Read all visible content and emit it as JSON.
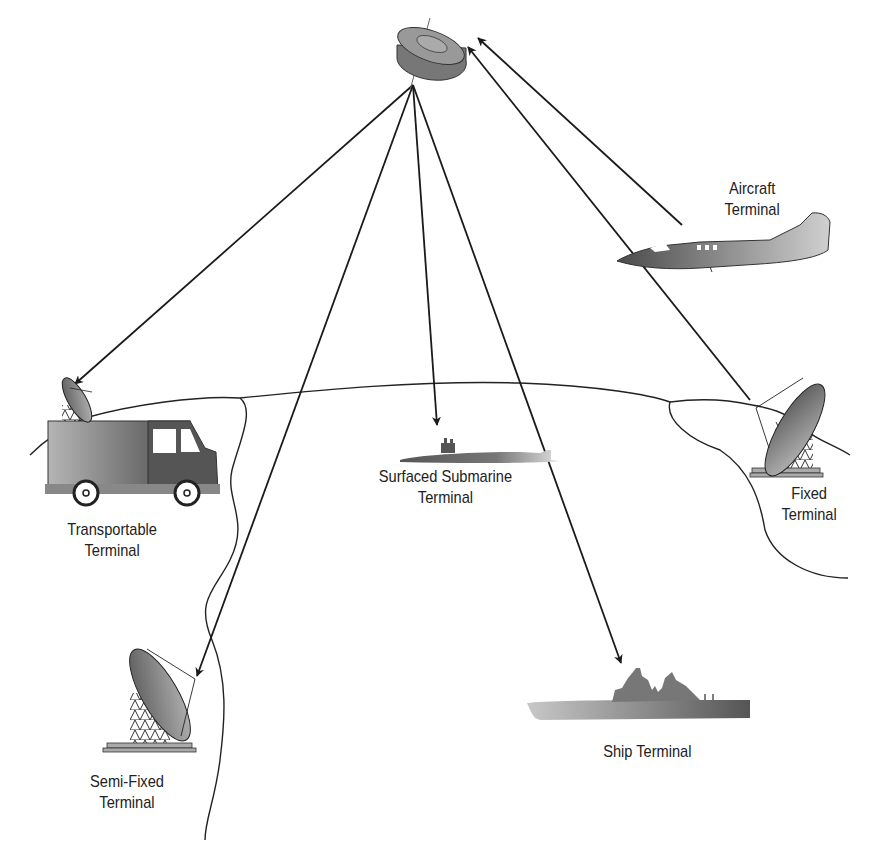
{
  "diagram": {
    "colors": {
      "line": "#1a1a1a",
      "fill_dark": "#555555",
      "fill_mid": "#8a8a8a",
      "fill_light": "#c8c8c8",
      "background": "#ffffff"
    },
    "satellite": {
      "name": "satellite",
      "icon": "satellite-icon"
    },
    "terminals": [
      {
        "id": "aircraft",
        "line1": "Aircraft",
        "line2": "Terminal",
        "icon": "aircraft-icon",
        "link": "uplink"
      },
      {
        "id": "transportable",
        "line1": "Transportable",
        "line2": "Terminal",
        "icon": "van-dish-icon",
        "link": "downlink"
      },
      {
        "id": "submarine",
        "line1": "Surfaced Submarine",
        "line2": "Terminal",
        "icon": "submarine-icon",
        "link": "downlink"
      },
      {
        "id": "fixed",
        "line1": "Fixed",
        "line2": "Terminal",
        "icon": "dish-antenna-icon",
        "link": "uplink"
      },
      {
        "id": "semifixed",
        "line1": "Semi-Fixed",
        "line2": "Terminal",
        "icon": "dish-antenna-icon",
        "link": "downlink"
      },
      {
        "id": "ship",
        "line1": "Ship Terminal",
        "line2": "",
        "icon": "ship-icon",
        "link": "downlink"
      }
    ]
  }
}
